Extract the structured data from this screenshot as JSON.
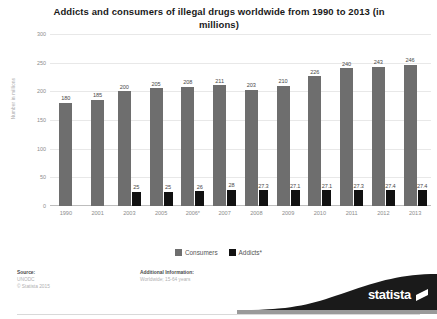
{
  "chart_data": {
    "type": "bar",
    "title": "Addicts and consumers of illegal drugs worldwide from 1990 to 2013 (in millions)",
    "xlabel": "",
    "ylabel": "Number in millions",
    "categories": [
      "1990",
      "2001",
      "2003",
      "2005",
      "2006*",
      "2007",
      "2008",
      "2009",
      "2010",
      "2011",
      "2012",
      "2013"
    ],
    "series": [
      {
        "name": "Consumers",
        "color": "#6e6e6e",
        "values": [
          180,
          185,
          200,
          205,
          208,
          211,
          203,
          210,
          226,
          240,
          243,
          246
        ],
        "labels": [
          "180",
          "185",
          "200",
          "205",
          "208",
          "211",
          "203",
          "210",
          "226",
          "240",
          "243",
          "246"
        ]
      },
      {
        "name": "Addicts*",
        "color": "#111111",
        "values": [
          null,
          null,
          25,
          25,
          26,
          28,
          27.3,
          27.1,
          27.1,
          27.3,
          27.4,
          27.4
        ],
        "labels": [
          "",
          "",
          "25",
          "25",
          "26",
          "28",
          "27.3",
          "27.1",
          "27.1",
          "27.3",
          "27.4",
          "27.4"
        ]
      }
    ],
    "ylim": [
      0,
      300
    ],
    "yticks": [
      0,
      50,
      100,
      150,
      200,
      250,
      300
    ],
    "ytick_labels": [
      "0",
      "50",
      "100",
      "150",
      "200",
      "250",
      "300"
    ],
    "grid": true,
    "legend_position": "bottom"
  },
  "legend": [
    {
      "label": "Consumers",
      "color": "#6e6e6e"
    },
    {
      "label": "Addicts*",
      "color": "#111111"
    }
  ],
  "footer": {
    "source_heading": "Source:",
    "source_line1": "UNODC",
    "source_line2": "© Statista 2015",
    "additional_heading": "Additional Information:",
    "additional_line1": "Worldwide; 15-64 years"
  },
  "brand": {
    "name": "statista"
  }
}
